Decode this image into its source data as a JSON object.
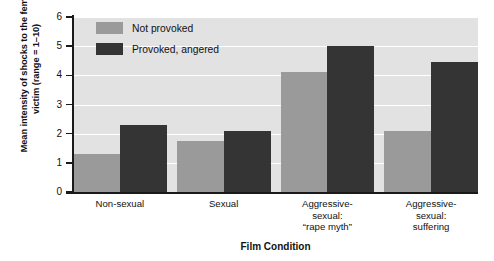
{
  "chart_data": {
    "type": "bar",
    "title": "",
    "xlabel": "Film Condition",
    "ylabel": "Mean intensity of shocks to the female victim (range = 1–10)",
    "ylim": [
      0,
      6
    ],
    "yticks": [
      "0",
      "1",
      "2",
      "3",
      "4",
      "5",
      "6"
    ],
    "grid": true,
    "legend_position": "top-left inside plot",
    "categories": [
      "Non-sexual",
      "Sexual",
      "Aggressive-sexual: “rape myth”",
      "Aggressive-sexual: suffering"
    ],
    "category_lines": [
      [
        "Non-sexual"
      ],
      [
        "Sexual"
      ],
      [
        "Aggressive-",
        "sexual:",
        "“rape myth”"
      ],
      [
        "Aggressive-",
        "sexual:",
        "suffering"
      ]
    ],
    "series": [
      {
        "name": "Not provoked",
        "color": "#9a9a9a",
        "values": [
          1.3,
          1.75,
          4.1,
          2.1
        ]
      },
      {
        "name": "Provoked, angered",
        "color": "#343434",
        "values": [
          2.3,
          2.1,
          5.0,
          4.45
        ]
      }
    ]
  },
  "legend": {
    "items": [
      {
        "label": "Not provoked"
      },
      {
        "label": "Provoked, angered"
      }
    ]
  },
  "axes": {
    "y_title": "Mean intensity of shocks to the female victim (range = 1–10)",
    "x_title": "Film Condition"
  },
  "colors": {
    "plot_background": "#e2e2e2",
    "gridline": "#ffffff",
    "axis": "#1a1a1a",
    "series_not_provoked": "#9a9a9a",
    "series_provoked": "#343434"
  }
}
